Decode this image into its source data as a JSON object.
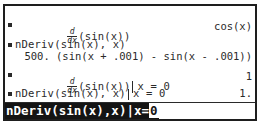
{
  "history": [
    {
      "expression": {
        "deriv_num": "d",
        "deriv_den": "dx",
        "body": "(sin(x))"
      },
      "result": "cos(x)"
    },
    {
      "expression": "nDeriv(sin(x), x)",
      "result": "500. (sin(x + .001) - sin(x - .001))"
    },
    {
      "expression": {
        "deriv_num": "d",
        "deriv_den": "dx",
        "body": "(sin(x))",
        "condition": "x = 0"
      },
      "result": "1"
    },
    {
      "expression": "nDeriv(sin(x), x)",
      "condition": "x = 0",
      "result": "1."
    }
  ],
  "entry_line": {
    "text": "nDeriv(sin(x),x)|x=",
    "cursor_char": "0"
  },
  "colors": {
    "background": "#ffffff",
    "text": "#2a2a2a",
    "entry_highlight": "#141414"
  }
}
